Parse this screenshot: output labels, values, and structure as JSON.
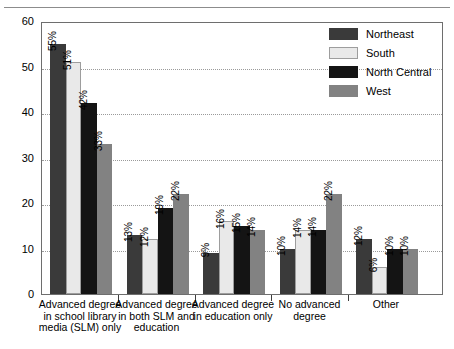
{
  "chart_data": {
    "type": "bar",
    "title": "",
    "subtitle": "",
    "xlabel": "",
    "ylabel": "",
    "ylim": [
      0,
      60
    ],
    "yticks": [
      0,
      10,
      20,
      30,
      40,
      50,
      60
    ],
    "grid": true,
    "legend_position": "top-right",
    "value_suffix": "%",
    "categories": [
      "Advanced degree in school library media (SLM) only",
      "Advanced degree in both SLM and education",
      "Advanced degree in education only",
      "No advanced degree",
      "Other"
    ],
    "category_lines": [
      [
        "Advanced degree",
        "in school library",
        "media (SLM) only"
      ],
      [
        "Advanced degree",
        "in both SLM and",
        "education"
      ],
      [
        "Advanced degree",
        "in education only"
      ],
      [
        "No advanced",
        "degree"
      ],
      [
        "Other"
      ]
    ],
    "series": [
      {
        "name": "Northeast",
        "color": "#3a3a3a",
        "values": [
          55,
          13,
          9,
          10,
          12
        ],
        "labels": [
          "55%",
          "13%",
          "9%",
          "10%",
          "12%"
        ]
      },
      {
        "name": "South",
        "color": "#e9e9e9",
        "values": [
          51,
          12,
          16,
          14,
          6
        ],
        "labels": [
          "51%",
          "12%",
          "16%",
          "14%",
          "6%"
        ]
      },
      {
        "name": "North Central",
        "color": "#141414",
        "values": [
          42,
          19,
          15,
          14,
          10
        ],
        "labels": [
          "42%",
          "19%",
          "15%",
          "14%",
          "10%"
        ]
      },
      {
        "name": "West",
        "color": "#828282",
        "values": [
          33,
          22,
          14,
          22,
          10
        ],
        "labels": [
          "33%",
          "22%",
          "14%",
          "22%",
          "10%"
        ]
      }
    ]
  }
}
